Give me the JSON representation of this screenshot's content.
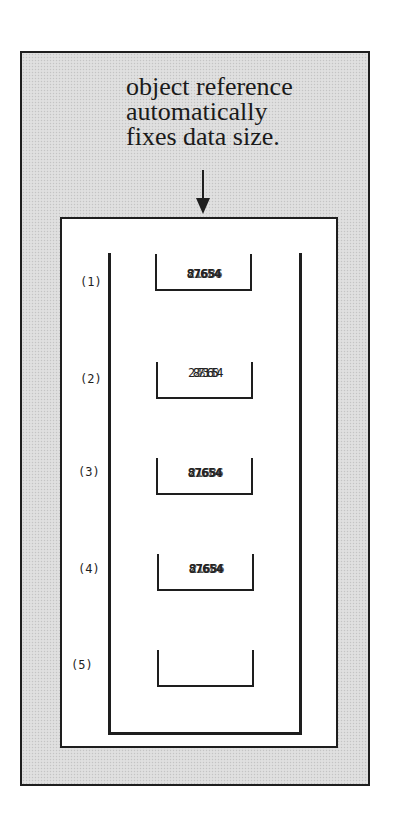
{
  "caption": {
    "lines": [
      "object reference",
      "automatically",
      "fixes data size."
    ]
  },
  "arrow": {
    "icon": "arrow-down-icon",
    "direction": "down"
  },
  "slots": [
    {
      "label": "(1)",
      "value": "87654",
      "overprint": "21686"
    },
    {
      "label": "(2)",
      "value": "2873654",
      "overprint": "28130"
    },
    {
      "label": "(3)",
      "value": "87654",
      "overprint": "21686"
    },
    {
      "label": "(4)",
      "value": "87654",
      "overprint": "21686"
    },
    {
      "label": "(5)",
      "value": "",
      "overprint": ""
    }
  ],
  "colors": {
    "line": "#1e1e1e",
    "stipple_background": "#dcdcdc",
    "inner_background": "#ffffff"
  }
}
